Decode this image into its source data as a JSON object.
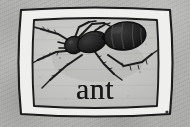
{
  "card": {
    "kind": "illustrated-flashcard",
    "word": "ant",
    "subject_icon": "ant-illustration",
    "frame_icon": "hand-drawn-double-line-frame",
    "media": "pencil-and-ink-drawing-on-gray-paper"
  },
  "colors": {
    "paper_background": "#b3b3b1",
    "inner_panel": "#c6c6c4",
    "frame_band": "#efefee",
    "ink": "#161616",
    "word_color": "#171717"
  },
  "illustration": {
    "title": "ant",
    "orientation": "head-left-abdomen-right",
    "parts": [
      "antennae",
      "head",
      "mandibles",
      "thorax",
      "petiole",
      "abdomen",
      "legs"
    ],
    "leg_count": 6,
    "antenna_count": 2
  },
  "marks": {
    "corner_speck": "ink-speck-bottom-right"
  }
}
